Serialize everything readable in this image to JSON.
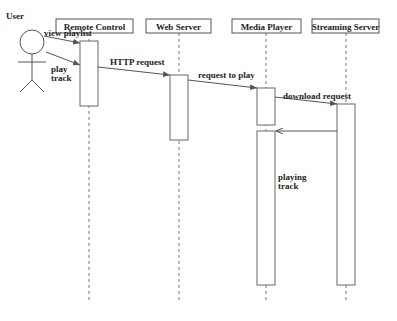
{
  "diagram": {
    "type": "sequence",
    "actor": {
      "label": "User"
    },
    "participants": [
      {
        "id": "remote",
        "label": "Remote Control"
      },
      {
        "id": "web",
        "label": "Web Server"
      },
      {
        "id": "media",
        "label": "Media Player"
      },
      {
        "id": "stream",
        "label": "Streaming Server"
      }
    ],
    "messages": [
      {
        "from": "User",
        "to": "Remote Control",
        "label": "view playlist"
      },
      {
        "from": "User",
        "to": "Remote Control",
        "label_line1": "play",
        "label_line2": "track"
      },
      {
        "from": "Remote Control",
        "to": "Web Server",
        "label": "HTTP request"
      },
      {
        "from": "Web Server",
        "to": "Media Player",
        "label": "request to play"
      },
      {
        "from": "Media Player",
        "to": "Streaming Server",
        "label": "download request"
      },
      {
        "from": "Streaming Server",
        "to": "Media Player",
        "label": "",
        "kind": "return"
      }
    ],
    "notes": [
      {
        "on": "Media Player",
        "label_line1": "playing",
        "label_line2": "track"
      }
    ]
  }
}
